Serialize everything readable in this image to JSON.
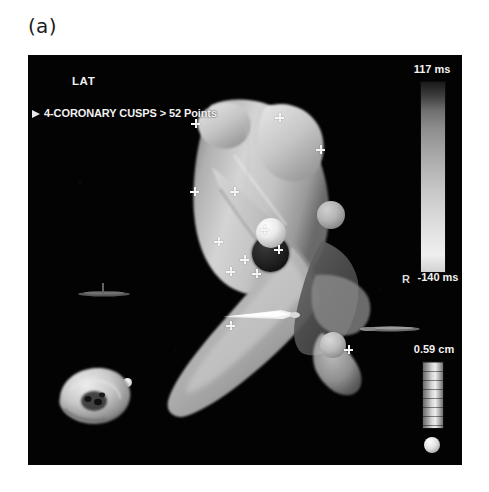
{
  "figure": {
    "panel_label": "(a)"
  },
  "overlay": {
    "map_type": "LAT",
    "annotation": "4-CORONARY CUSPS > 52 Points",
    "orientation_marker": "R"
  },
  "lat_scale": {
    "max_label": "117 ms",
    "min_label": "-140 ms",
    "unit": "ms",
    "max_value": 117,
    "min_value": -140,
    "colormap": "grayscale"
  },
  "distance_scale": {
    "label": "0.59 cm",
    "value": 0.59,
    "unit": "cm"
  },
  "map_points": {
    "count": 52,
    "structure": "coronary cusps",
    "cusp_count": 4
  },
  "colors": {
    "background": "#ffffff",
    "viewport": "#030303",
    "overlay_text": "#f2f2f2",
    "mesh_light": "#d7d7d7",
    "mesh_mid": "#9a9a9a",
    "mesh_shadow": "#5a5a5a"
  },
  "markers": {
    "sphere_bright_center": "bright-marker-sphere",
    "sphere_dark_center": "dark-marker-sphere",
    "sphere_right_upper": "upper-right-marker-sphere",
    "sphere_right_lower": "lower-right-marker-sphere",
    "sphere_apex_tip": "apex-tip-marker"
  },
  "crosses": [
    {
      "x": 163,
      "y": 64
    },
    {
      "x": 247,
      "y": 58
    },
    {
      "x": 288,
      "y": 90
    },
    {
      "x": 162,
      "y": 132
    },
    {
      "x": 202,
      "y": 132
    },
    {
      "x": 232,
      "y": 170
    },
    {
      "x": 246,
      "y": 190
    },
    {
      "x": 212,
      "y": 200
    },
    {
      "x": 198,
      "y": 212
    },
    {
      "x": 224,
      "y": 214
    },
    {
      "x": 186,
      "y": 182
    },
    {
      "x": 316,
      "y": 290
    },
    {
      "x": 198,
      "y": 266
    }
  ]
}
